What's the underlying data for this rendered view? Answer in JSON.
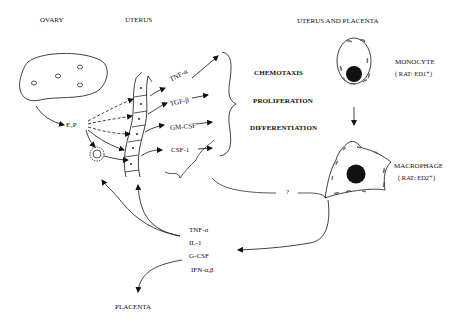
{
  "regions": {
    "ovary": "OVARY",
    "uterus": "UTERUS",
    "uterus_placenta": "UTERUS AND PLACENTA",
    "placenta": "PLACENTA"
  },
  "hormone": "E₂P",
  "uterine_cytokines": [
    "TNF-α",
    "TGF-β",
    "GM-CSF",
    "CSF-1"
  ],
  "effects": [
    "CHEMOTAXIS",
    "PROLIFERATION",
    "DIFFERENTIATION"
  ],
  "cells": {
    "monocyte": {
      "name": "MONOCYTE",
      "marker": "( RAT: ED1⁺)"
    },
    "macrophage": {
      "name": "MACROPHAGE",
      "marker": "( RAT: ED2⁺)"
    }
  },
  "unknown_link": "?",
  "macrophage_products": [
    "TNF-α",
    "IL-1",
    "G-CSF",
    "IFN-α,β"
  ]
}
